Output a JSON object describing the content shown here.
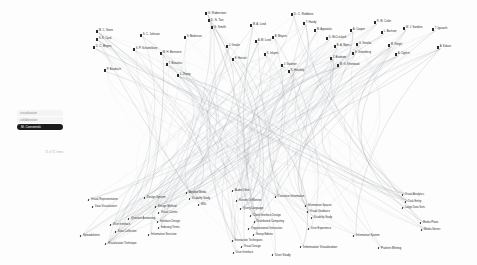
{
  "view": {
    "title": "Author–Keyword Bundled Network",
    "background_color": "#fdfdfd",
    "edge_color": "#9aa0a6",
    "text_color": "#2b2b2b",
    "highlight_color": "#1c1c1c"
  },
  "panel": {
    "rows": [
      {
        "label": "visualization",
        "selected": false
      },
      {
        "label": "collaboration",
        "selected": false
      },
      {
        "label": "M. Czerwinski",
        "selected": true
      }
    ],
    "caption": "71 of 71 items"
  },
  "authors": [
    {
      "label": "M. C. Stone",
      "x": 96,
      "y": 30,
      "size": "s"
    },
    {
      "label": "S. K. Card",
      "x": 96,
      "y": 38,
      "size": "s"
    },
    {
      "label": "D. C. Meyers",
      "x": 93,
      "y": 46,
      "size": "s"
    },
    {
      "label": "P. Baudisch",
      "x": 104,
      "y": 69,
      "size": "s"
    },
    {
      "label": "S. C. Johnson",
      "x": 140,
      "y": 34,
      "size": "s"
    },
    {
      "label": "S. P. Schottelkorp",
      "x": 133,
      "y": 48,
      "size": "s"
    },
    {
      "label": "M. H. Bernstein",
      "x": 160,
      "y": 52,
      "size": "s"
    },
    {
      "label": "T. Beaulieu",
      "x": 166,
      "y": 63,
      "size": "s"
    },
    {
      "label": "S. Bederson",
      "x": 184,
      "y": 36,
      "size": "s"
    },
    {
      "label": "J. Zhang",
      "x": 177,
      "y": 74,
      "size": "s"
    },
    {
      "label": "G. Robertson",
      "x": 205,
      "y": 12,
      "size": "m"
    },
    {
      "label": "D. S. Tan",
      "x": 208,
      "y": 19,
      "size": "m"
    },
    {
      "label": "G. Smith",
      "x": 211,
      "y": 26,
      "size": "m"
    },
    {
      "label": "J. Grudin",
      "x": 226,
      "y": 45,
      "size": "s"
    },
    {
      "label": "E. Horvitz",
      "x": 232,
      "y": 58,
      "size": "s"
    },
    {
      "label": "M. A. Lund",
      "x": 250,
      "y": 24,
      "size": "s"
    },
    {
      "label": "A. M. Lund",
      "x": 255,
      "y": 40,
      "size": "s"
    },
    {
      "label": "K. Inkpen",
      "x": 264,
      "y": 53,
      "size": "s"
    },
    {
      "label": "B. Meyers",
      "x": 272,
      "y": 36,
      "size": "s"
    },
    {
      "label": "J. Gardner",
      "x": 281,
      "y": 64,
      "size": "s"
    },
    {
      "label": "K. Hinckley",
      "x": 288,
      "y": 70,
      "size": "s"
    },
    {
      "label": "D. C. Robbins",
      "x": 291,
      "y": 13,
      "size": "m"
    },
    {
      "label": "T. Handy",
      "x": 303,
      "y": 22,
      "size": "s"
    },
    {
      "label": "M. Agrawala",
      "x": 314,
      "y": 29,
      "size": "s"
    },
    {
      "label": "D. McCrickard",
      "x": 326,
      "y": 37,
      "size": "s"
    },
    {
      "label": "B. A. Myers",
      "x": 334,
      "y": 45,
      "size": "s"
    },
    {
      "label": "J. Bardram",
      "x": 330,
      "y": 57,
      "size": "s"
    },
    {
      "label": "M. G. Sherwood",
      "x": 337,
      "y": 64,
      "size": "s"
    },
    {
      "label": "A. Cooper",
      "x": 350,
      "y": 29,
      "size": "s"
    },
    {
      "label": "G. Venolia",
      "x": 356,
      "y": 43,
      "size": "s"
    },
    {
      "label": "S. Greenberg",
      "x": 352,
      "y": 52,
      "size": "s"
    },
    {
      "label": "R. M. Cutler",
      "x": 374,
      "y": 21,
      "size": "s"
    },
    {
      "label": "L. Bartram",
      "x": 381,
      "y": 31,
      "size": "s"
    },
    {
      "label": "M. Ringel",
      "x": 388,
      "y": 44,
      "size": "s"
    },
    {
      "label": "A. Cypher",
      "x": 395,
      "y": 53,
      "size": "s"
    },
    {
      "label": "W. J. Sanders",
      "x": 403,
      "y": 27,
      "size": "s"
    },
    {
      "label": "T. Igarashi",
      "x": 432,
      "y": 28,
      "size": "s"
    },
    {
      "label": "A. Kaban",
      "x": 437,
      "y": 46,
      "size": "s"
    }
  ],
  "keywords": [
    {
      "label": "Visual Representation",
      "x": 88,
      "y": 199,
      "size": "s"
    },
    {
      "label": "Data Visualization",
      "x": 92,
      "y": 206,
      "size": "s"
    },
    {
      "label": "Spreadsheets",
      "x": 80,
      "y": 235,
      "size": "s"
    },
    {
      "label": "User Interface",
      "x": 110,
      "y": 224,
      "size": "s"
    },
    {
      "label": "Data Collection",
      "x": 115,
      "y": 231,
      "size": "s"
    },
    {
      "label": "Visualization Technique",
      "x": 105,
      "y": 243,
      "size": "s"
    },
    {
      "label": "Design System",
      "x": 144,
      "y": 197,
      "size": "s"
    },
    {
      "label": "Design Method",
      "x": 155,
      "y": 206,
      "size": "s"
    },
    {
      "label": "Visual Cortex",
      "x": 158,
      "y": 212,
      "size": "s"
    },
    {
      "label": "Question Answering",
      "x": 128,
      "y": 218,
      "size": "s"
    },
    {
      "label": "Interface Design",
      "x": 157,
      "y": 221,
      "size": "s"
    },
    {
      "label": "Indexing Terms",
      "x": 158,
      "y": 227,
      "size": "s"
    },
    {
      "label": "Information Structure",
      "x": 148,
      "y": 234,
      "size": "s"
    },
    {
      "label": "Applied Media",
      "x": 186,
      "y": 192,
      "size": "s"
    },
    {
      "label": "Usability Study",
      "x": 189,
      "y": 198,
      "size": "s"
    },
    {
      "label": "Wiki",
      "x": 198,
      "y": 204,
      "size": "s"
    },
    {
      "label": "Audio Other",
      "x": 232,
      "y": 190,
      "size": "s"
    },
    {
      "label": "Screen Or Monitor",
      "x": 236,
      "y": 200,
      "size": "s"
    },
    {
      "label": "Query Language",
      "x": 240,
      "y": 208,
      "size": "s"
    },
    {
      "label": "Client Interface Design",
      "x": 250,
      "y": 215,
      "size": "s"
    },
    {
      "label": "Distributed Computing",
      "x": 254,
      "y": 221,
      "size": "s"
    },
    {
      "label": "Organizational Interaction",
      "x": 248,
      "y": 228,
      "size": "s"
    },
    {
      "label": "Group Editors",
      "x": 253,
      "y": 234,
      "size": "s"
    },
    {
      "label": "Interaction Techniques",
      "x": 232,
      "y": 240,
      "size": "s"
    },
    {
      "label": "Visual Design",
      "x": 241,
      "y": 246,
      "size": "s"
    },
    {
      "label": "User Interface",
      "x": 233,
      "y": 252,
      "size": "s"
    },
    {
      "label": "Transitive Information",
      "x": 275,
      "y": 196,
      "size": "s"
    },
    {
      "label": "Information Spaces",
      "x": 305,
      "y": 205,
      "size": "s"
    },
    {
      "label": "Visual Guidance",
      "x": 307,
      "y": 211,
      "size": "s"
    },
    {
      "label": "Usability Study",
      "x": 311,
      "y": 217,
      "size": "s"
    },
    {
      "label": "User Experience",
      "x": 308,
      "y": 228,
      "size": "s"
    },
    {
      "label": "Information System",
      "x": 353,
      "y": 235,
      "size": "s"
    },
    {
      "label": "Information Visualization",
      "x": 300,
      "y": 246,
      "size": "m"
    },
    {
      "label": "User Study",
      "x": 272,
      "y": 254,
      "size": "m"
    },
    {
      "label": "Pattern Mining",
      "x": 378,
      "y": 247,
      "size": "m"
    },
    {
      "label": "Visual Analytics",
      "x": 402,
      "y": 194,
      "size": "s"
    },
    {
      "label": "Task Entity",
      "x": 405,
      "y": 201,
      "size": "s"
    },
    {
      "label": "Large Data Sets",
      "x": 402,
      "y": 207,
      "size": "s"
    },
    {
      "label": "Media Plane",
      "x": 420,
      "y": 222,
      "size": "s"
    },
    {
      "label": "Media Server",
      "x": 421,
      "y": 229,
      "size": "s"
    }
  ]
}
